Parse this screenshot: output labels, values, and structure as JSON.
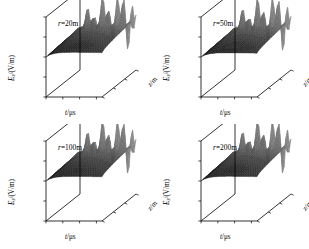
{
  "figure": {
    "type": "multi-panel-3d-surface-grid",
    "rows": 2,
    "cols": 2,
    "background": "#ffffff",
    "surface_color": "#3a3a3a",
    "surface_ridge_color": "#8a8a8a",
    "axis_color": "#000000"
  },
  "chart_data": [
    {
      "type": "surface",
      "title": "r=20m",
      "title_parts": {
        "var": "r",
        "rest": "=20m"
      },
      "xlabel": "t/μs",
      "ylabel": "E_z/(V/m)",
      "zlabel": "z/m",
      "xticks": [
        "0",
        "300",
        "600",
        "900"
      ],
      "xvalues": [
        0,
        300,
        600,
        900
      ],
      "yticks": [
        "80000",
        "40000",
        "0",
        "-40000",
        "-80000"
      ],
      "yvalues": [
        80000,
        40000,
        0,
        -40000,
        -80000
      ],
      "ylim": [
        -80000,
        80000
      ],
      "zticks": [
        "6000",
        "4000",
        "2000",
        "0"
      ],
      "zvalues": [
        6000,
        4000,
        2000,
        0
      ],
      "zlim": [
        0,
        6000
      ],
      "xlim": [
        0,
        1000
      ],
      "grid": false,
      "legend": "none",
      "peak_amplitude": 80000,
      "plateau_amplitude": 30000,
      "notes": "Dark wedge surface rising from 0 at near depth to a plateau; large oscillatory fan-shaped spikes at the far depth edge spanning the full vertical range."
    },
    {
      "type": "surface",
      "title": "r=50m",
      "title_parts": {
        "var": "r",
        "rest": "=50m"
      },
      "xlabel": "t/μs",
      "ylabel": "E_z/(V/m)",
      "zlabel": "z/m",
      "xticks": [
        "0",
        "300",
        "600",
        "900"
      ],
      "xvalues": [
        0,
        300,
        600,
        900
      ],
      "yticks": [
        "60000",
        "30000",
        "0",
        "-30000",
        "-60000"
      ],
      "yvalues": [
        60000,
        30000,
        0,
        -30000,
        -60000
      ],
      "ylim": [
        -60000,
        60000
      ],
      "zticks": [
        "6000",
        "4000",
        "2000",
        "0"
      ],
      "zvalues": [
        6000,
        4000,
        2000,
        0
      ],
      "zlim": [
        0,
        6000
      ],
      "xlim": [
        0,
        1000
      ],
      "grid": false,
      "legend": "none",
      "peak_amplitude": 60000,
      "plateau_amplitude": 20000,
      "notes": "Same wedge morphology with reduced amplitude at larger radial distance."
    },
    {
      "type": "surface",
      "title": "r=100m",
      "title_parts": {
        "var": "r",
        "rest": "=100m"
      },
      "xlabel": "t/μs",
      "ylabel": "E_z/(V/m)",
      "zlabel": "z/m",
      "xticks": [
        "0",
        "300",
        "600",
        "900"
      ],
      "xvalues": [
        0,
        300,
        600,
        900
      ],
      "yticks": [
        "30000",
        "15000",
        "0",
        "-15000",
        "-30000"
      ],
      "yvalues": [
        30000,
        15000,
        0,
        -15000,
        -30000
      ],
      "ylim": [
        -30000,
        30000
      ],
      "zticks": [
        "6000",
        "4000",
        "2000",
        "0"
      ],
      "zvalues": [
        6000,
        4000,
        2000,
        0
      ],
      "zlim": [
        0,
        6000
      ],
      "xlim": [
        0,
        1000
      ],
      "grid": false,
      "legend": "none",
      "peak_amplitude": 30000,
      "plateau_amplitude": 11000,
      "notes": "Wedge surface with oscillatory spikes at far depth edge."
    },
    {
      "type": "surface",
      "title": "r=200m",
      "title_parts": {
        "var": "r",
        "rest": "=200m"
      },
      "xlabel": "t/μs",
      "ylabel": "E_z/(V/m)",
      "zlabel": "z/m",
      "xticks": [
        "0",
        "300",
        "600",
        "900"
      ],
      "xvalues": [
        0,
        300,
        600,
        900
      ],
      "yticks": [
        "8000",
        "4000",
        "0",
        "-4000",
        "-8000"
      ],
      "yvalues": [
        8000,
        4000,
        0,
        -4000,
        -8000
      ],
      "ylim": [
        -8000,
        8000
      ],
      "zticks": [
        "6000",
        "4000",
        "2000",
        "0"
      ],
      "zvalues": [
        6000,
        4000,
        2000,
        0
      ],
      "zlim": [
        0,
        6000
      ],
      "xlim": [
        0,
        1000
      ],
      "grid": false,
      "legend": "none",
      "peak_amplitude": 8000,
      "plateau_amplitude": 3000,
      "notes": "Wedge surface, smallest amplitude of the four panels."
    }
  ]
}
